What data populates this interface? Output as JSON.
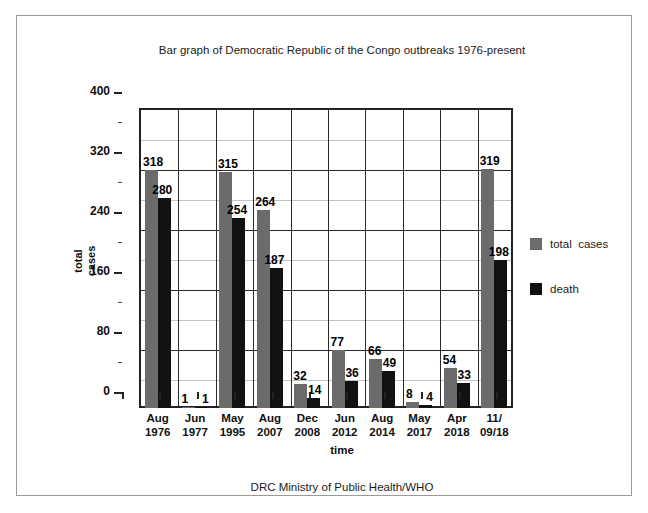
{
  "chart_data": {
    "type": "bar",
    "title": "Bar graph of Democratic Republic of the Congo outbreaks 1976-present",
    "xlabel": "time",
    "ylabel": "total\ncases",
    "categories": [
      "Aug\n1976",
      "Jun\n1977",
      "May\n1995",
      "Aug\n2007",
      "Dec\n2008",
      "Jun\n2012",
      "Aug\n2014",
      "May\n2017",
      "Apr\n2018",
      "11/\n09/18"
    ],
    "series": [
      {
        "name": "total  cases",
        "color": "#6b6b6b",
        "values": [
          318,
          1,
          315,
          264,
          32,
          77,
          66,
          8,
          54,
          319
        ]
      },
      {
        "name": "death",
        "color": "#111111",
        "values": [
          280,
          1,
          254,
          187,
          14,
          36,
          49,
          4,
          33,
          198
        ]
      }
    ],
    "ylim": [
      0,
      400
    ],
    "yticks": [
      0,
      80,
      160,
      240,
      320,
      400
    ],
    "yticks_minor": [
      40,
      120,
      200,
      280,
      360
    ],
    "grid": true,
    "legend_position": "right"
  },
  "footer": {
    "source": "DRC Ministry of Public Health/WHO"
  }
}
